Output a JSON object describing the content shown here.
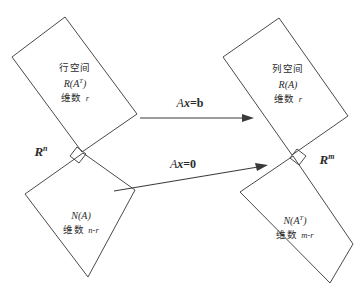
{
  "figure": {
    "stroke_color": "#4a4a4a",
    "text_color": "#2b2b2b",
    "background": "#ffffff"
  },
  "blocks": [
    {
      "id": "row-space",
      "cjk_name": "行空间",
      "math_name": "R(A",
      "math_sup": "T",
      "math_tail": ")",
      "dim_word": "维数",
      "dim_value": "r"
    },
    {
      "id": "column-space",
      "cjk_name": "列空间",
      "math_name": "R(A",
      "math_sup": "",
      "math_tail": ")",
      "dim_word": "维数",
      "dim_value": "r"
    },
    {
      "id": "null-space",
      "cjk_name": "",
      "math_name": "N(A",
      "math_sup": "",
      "math_tail": ")",
      "dim_word": "维数",
      "dim_value": "n-r"
    },
    {
      "id": "left-null-space",
      "cjk_name": "",
      "math_name": "N(A",
      "math_sup": "T",
      "math_tail": ")",
      "dim_word": "维数",
      "dim_value": "m-r"
    }
  ],
  "space_labels": {
    "domain": {
      "base": "R",
      "exponent": "n"
    },
    "codomain": {
      "base": "R",
      "exponent": "m"
    }
  },
  "arrows": [
    {
      "id": "map-to-b",
      "operator": "A",
      "vector": "x",
      "equals": "=",
      "result": "b"
    },
    {
      "id": "map-to-zero",
      "operator": "A",
      "vector": "x",
      "equals": "=",
      "result": "0"
    }
  ]
}
